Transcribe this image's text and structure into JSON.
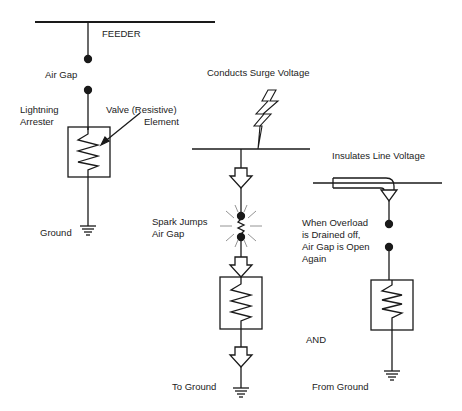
{
  "diagram": {
    "panel_left": {
      "feeder_label": "FEEDER",
      "air_gap_label": "Air Gap",
      "arrester_label_line1": "Lightning",
      "arrester_label_line2": "Arrester",
      "valve_label_line1": "Valve (Resistive)",
      "valve_label_line2": "Element",
      "ground_label": "Ground"
    },
    "panel_middle": {
      "surge_label": "Conducts Surge Voltage",
      "spark_label_line1": "Spark Jumps",
      "spark_label_line2": "Air Gap",
      "to_ground_label": "To Ground"
    },
    "connector": {
      "and_label": "AND"
    },
    "panel_right": {
      "insulates_label": "Insulates Line Voltage",
      "overload_line1": "When Overload",
      "overload_line2": "is Drained off,",
      "overload_line3": "Air Gap is Open",
      "overload_line4": "Again",
      "from_ground_label": "From Ground"
    },
    "colors": {
      "line": "#1a1a1a",
      "background": "#ffffff"
    }
  }
}
